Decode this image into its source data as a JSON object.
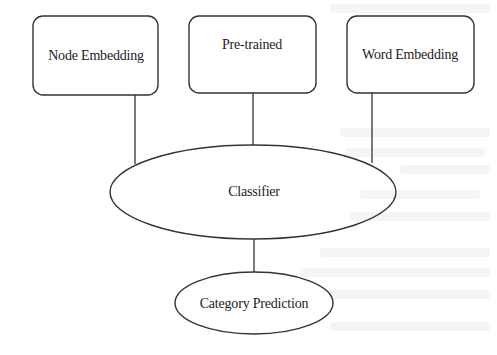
{
  "diagram": {
    "type": "flow",
    "nodes": {
      "node_embedding": {
        "label": "Node Embedding",
        "shape": "rounded-rect"
      },
      "pretrained": {
        "label": "Pre-trained",
        "shape": "rounded-rect"
      },
      "word_embedding": {
        "label": "Word Embedding",
        "shape": "rounded-rect"
      },
      "classifier": {
        "label": "Classifier",
        "shape": "ellipse"
      },
      "category_prediction": {
        "label": "Category Prediction",
        "shape": "ellipse"
      }
    },
    "edges": [
      {
        "from": "Node Embedding",
        "to": "Classifier"
      },
      {
        "from": "Pre-trained",
        "to": "Classifier"
      },
      {
        "from": "Word Embedding",
        "to": "Classifier"
      },
      {
        "from": "Classifier",
        "to": "Category Prediction"
      }
    ],
    "colors": {
      "stroke": "#333333",
      "fill": "#ffffff",
      "text": "#222222"
    }
  }
}
